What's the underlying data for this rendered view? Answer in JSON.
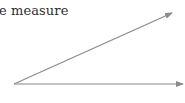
{
  "caption": {
    "text": "e measure"
  },
  "diagram": {
    "type": "angle",
    "vertex": [
      14,
      84
    ],
    "rays": [
      {
        "name": "upper-ray",
        "end": [
          172,
          13
        ]
      },
      {
        "name": "lower-ray",
        "end": [
          183,
          84
        ]
      }
    ],
    "line_color": "#8a8a8a"
  }
}
